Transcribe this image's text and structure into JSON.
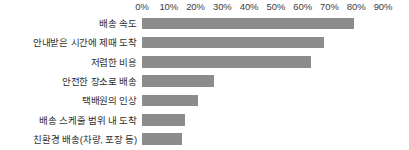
{
  "chart_data": {
    "type": "bar",
    "orientation": "horizontal",
    "title": "",
    "subtitle": "",
    "xlabel": "",
    "ylabel": "",
    "xlim": [
      0,
      90
    ],
    "grid": false,
    "legend": null,
    "bar_color": "#8c8c8c",
    "axis_position": "top",
    "value_suffix": "%",
    "tick_labels": [
      "0%",
      "10%",
      "20%",
      "30%",
      "40%",
      "50%",
      "60%",
      "70%",
      "80%",
      "90%"
    ],
    "ticks": [
      0,
      10,
      20,
      30,
      40,
      50,
      60,
      70,
      80,
      90
    ],
    "categories": [
      "배송 속도",
      "안내받은 시간에 제때 도착",
      "저렴한 비용",
      "안전한 장소로 배송",
      "택배원의 인상",
      "배송 스케줄 범위 내 도착",
      "친환경 배송(차량, 포장 등)"
    ],
    "values": [
      79,
      68,
      63,
      27,
      21,
      16,
      15
    ]
  }
}
